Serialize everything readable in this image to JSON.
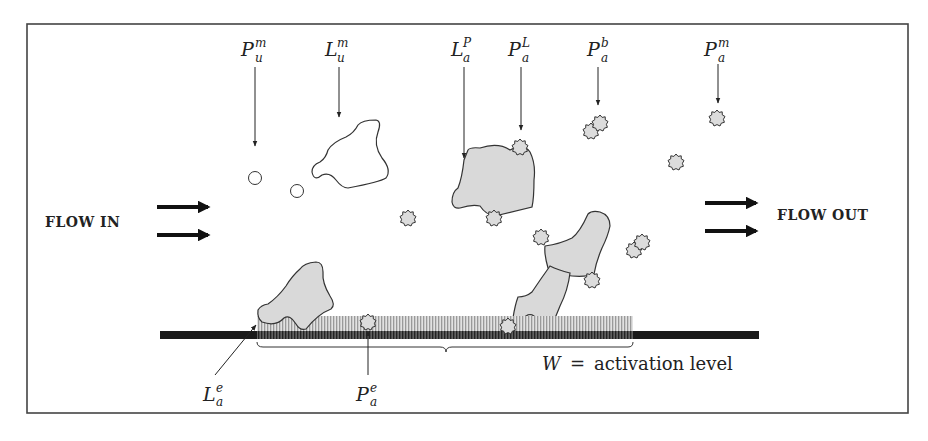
{
  "figure": {
    "flow_in_label": "FLOW IN",
    "flow_out_label": "FLOW OUT",
    "caption": {
      "var": "W",
      "eq": "=",
      "text": "activation level"
    },
    "top_labels": [
      {
        "base": "P",
        "sup": "m",
        "sub": "u",
        "meaning": "unbound mobile protein"
      },
      {
        "base": "L",
        "sup": "m",
        "sub": "u",
        "meaning": "unbound mobile ligand"
      },
      {
        "base": "L",
        "sup": "P",
        "sub": "a",
        "meaning": "activated ligand bound to protein"
      },
      {
        "base": "P",
        "sup": "L",
        "sub": "a",
        "meaning": "activated protein bound to ligand"
      },
      {
        "base": "P",
        "sup": "b",
        "sub": "a",
        "meaning": "activated bound protein"
      },
      {
        "base": "P",
        "sup": "m",
        "sub": "a",
        "meaning": "activated mobile protein"
      }
    ],
    "bottom_labels": [
      {
        "base": "L",
        "sup": "e",
        "sub": "a"
      },
      {
        "base": "P",
        "sup": "e",
        "sub": "a"
      }
    ],
    "colors": {
      "shape_fill": "#d9d9d9",
      "stroke": "#333333",
      "bar": "#1a1a1a",
      "hatch": "#9a9a9a",
      "frame": "#444444"
    }
  }
}
